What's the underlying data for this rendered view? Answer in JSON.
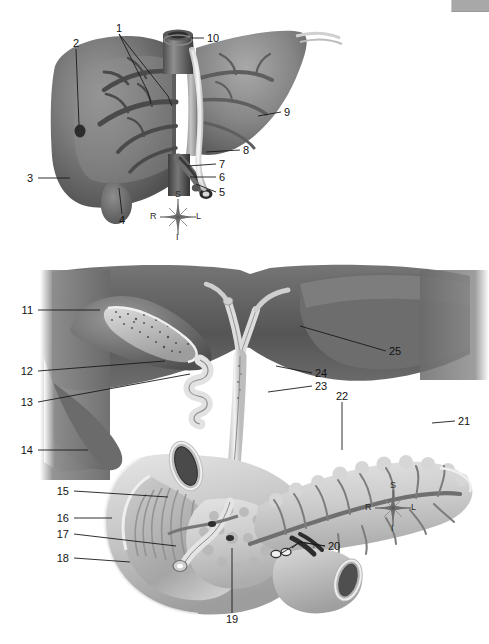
{
  "figure": {
    "background_color": "#ffffff",
    "ink_color": "#131313",
    "corner_swatch_color": "#a8a8a8"
  },
  "panels": [
    {
      "id": "liver",
      "name": "liver-illustration"
    },
    {
      "id": "pancreas",
      "name": "gallbladder-pancreas-duodenum-illustration"
    }
  ],
  "labels": [
    {
      "n": "1",
      "x": 119,
      "y": 28,
      "align": "c"
    },
    {
      "n": "2",
      "x": 76,
      "y": 43,
      "align": "c"
    },
    {
      "n": "3",
      "x": 33,
      "y": 178,
      "align": "r"
    },
    {
      "n": "4",
      "x": 122,
      "y": 220,
      "align": "c"
    },
    {
      "n": "5",
      "x": 219,
      "y": 192,
      "align": "l"
    },
    {
      "n": "6",
      "x": 219,
      "y": 177,
      "align": "l"
    },
    {
      "n": "7",
      "x": 219,
      "y": 164,
      "align": "l"
    },
    {
      "n": "8",
      "x": 243,
      "y": 150,
      "align": "l"
    },
    {
      "n": "9",
      "x": 284,
      "y": 112,
      "align": "l"
    },
    {
      "n": "10",
      "x": 207,
      "y": 38,
      "align": "l"
    },
    {
      "n": "11",
      "x": 33,
      "y": 310,
      "align": "r"
    },
    {
      "n": "12",
      "x": 33,
      "y": 371,
      "align": "r"
    },
    {
      "n": "13",
      "x": 33,
      "y": 402,
      "align": "r"
    },
    {
      "n": "14",
      "x": 33,
      "y": 450,
      "align": "r"
    },
    {
      "n": "15",
      "x": 69,
      "y": 491,
      "align": "r"
    },
    {
      "n": "16",
      "x": 69,
      "y": 518,
      "align": "r"
    },
    {
      "n": "17",
      "x": 69,
      "y": 534,
      "align": "r"
    },
    {
      "n": "18",
      "x": 69,
      "y": 558,
      "align": "r"
    },
    {
      "n": "19",
      "x": 232,
      "y": 619,
      "align": "c"
    },
    {
      "n": "20",
      "x": 328,
      "y": 546,
      "align": "l"
    },
    {
      "n": "21",
      "x": 458,
      "y": 421,
      "align": "l"
    },
    {
      "n": "22",
      "x": 342,
      "y": 396,
      "align": "c"
    },
    {
      "n": "23",
      "x": 315,
      "y": 386,
      "align": "l"
    },
    {
      "n": "24",
      "x": 315,
      "y": 373,
      "align": "l"
    },
    {
      "n": "25",
      "x": 389,
      "y": 351,
      "align": "l"
    }
  ],
  "compasses": [
    {
      "name": "orientation-compass-top",
      "x": 178,
      "y": 217,
      "superior": "S",
      "inferior": "I",
      "right": "R",
      "left": "L"
    },
    {
      "name": "orientation-compass-bottom",
      "x": 393,
      "y": 508,
      "superior": "S",
      "inferior": "I",
      "right": "R",
      "left": "L"
    }
  ]
}
